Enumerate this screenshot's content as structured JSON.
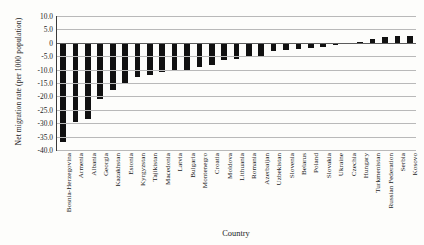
{
  "chart_data": {
    "type": "bar",
    "title": "",
    "xlabel": "Country",
    "ylabel": "Net migration rate (per 1000 population)",
    "ylim": [
      -40.0,
      10.0
    ],
    "ytick_labels": [
      "10.0",
      "5.0",
      "0",
      "-5.0",
      "-10.0",
      "-15.0",
      "-20.0",
      "-25.0",
      "-30.0",
      "-35.0",
      "-40.0"
    ],
    "ytick_values": [
      10,
      5,
      0,
      -5,
      -10,
      -15,
      -20,
      -25,
      -30,
      -35,
      -40
    ],
    "grid": true,
    "legend": "none",
    "bar_color": "#111111",
    "categories": [
      "Bosnia-Herzegovina",
      "Armenia",
      "Albania",
      "Georgia",
      "Kazakhstan",
      "Estonia",
      "Kyrgyzstan",
      "Tajikistan",
      "Macedonia",
      "Latvia",
      "Bulgaria",
      "Montenegro",
      "Croatia",
      "Moldova",
      "Lithuania",
      "Romania",
      "Azerbaijan",
      "Uzbekistan",
      "Slovenia",
      "Belarus",
      "Poland",
      "Slovakia",
      "Ukraine",
      "Czechia",
      "Hungary",
      "Turkmenistan",
      "Russian Federation",
      "Serbia",
      "Kosovo"
    ],
    "values": [
      -37.0,
      -29.5,
      -28.5,
      -21.0,
      -17.5,
      -15.0,
      -12.6,
      -12.0,
      -11.0,
      -10.6,
      -10.0,
      -9.0,
      -8.4,
      -6.6,
      -6.0,
      -5.4,
      -5.0,
      -3.0,
      -2.7,
      -2.4,
      -1.9,
      -1.4,
      -1.0,
      -0.6,
      0.4,
      1.3,
      2.0,
      2.4,
      2.4
    ]
  }
}
